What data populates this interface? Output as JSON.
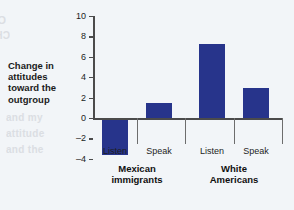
{
  "chart_data": {
    "type": "bar",
    "title": "",
    "subtitle": "",
    "xlabel": "",
    "ylabel": "Change in attitudes toward the outgroup",
    "ylim": [
      -4,
      10
    ],
    "ytick_values": [
      10,
      8,
      6,
      4,
      2,
      0,
      -2,
      -4
    ],
    "ytick_labels": [
      "10",
      "8",
      "6",
      "4",
      "2",
      "0",
      "–2",
      "–4"
    ],
    "grid": false,
    "legend": "none",
    "bar_color": "#27348b",
    "background_color": "#f2f5f8",
    "axis_color": "#4b4b4b",
    "categories": [
      "Listen",
      "Speak",
      "Listen",
      "Speak"
    ],
    "values": [
      -3.5,
      1.5,
      7.3,
      2.9
    ],
    "groups": [
      {
        "label": "Mexican immigrants",
        "label_line1": "Mexican",
        "label_line2": "immigrants",
        "bars": [
          {
            "category": "Listen",
            "value": -3.5
          },
          {
            "category": "Speak",
            "value": 1.5
          }
        ]
      },
      {
        "label": "White Americans",
        "label_line1": "White",
        "label_line2": "Americans",
        "bars": [
          {
            "category": "Listen",
            "value": 7.3
          },
          {
            "category": "Speak",
            "value": 2.9
          }
        ]
      }
    ]
  },
  "ghost_text": {
    "line1": "COMMUNITY",
    "line2": "CHANGED",
    "line3": "and my",
    "line4": "attitude",
    "line5": "and the"
  }
}
